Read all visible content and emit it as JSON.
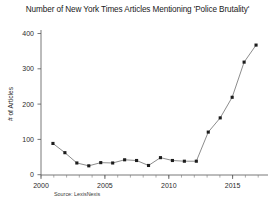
{
  "chart_data": {
    "type": "line",
    "title": "Number of New York Times Articles Mentioning 'Police Brutality'",
    "xlabel": "",
    "ylabel": "# of Articles",
    "source": "Source: LexisNexis",
    "grid": false,
    "legend": false,
    "xlim": [
      2000,
      2019
    ],
    "ylim": [
      0,
      430
    ],
    "xticks": [
      2000,
      2005,
      2010,
      2015
    ],
    "xtick_labels": [
      "2000",
      "2005",
      "2010",
      "2015"
    ],
    "yticks": [
      0,
      100,
      200,
      300,
      400
    ],
    "ytick_labels": [
      "0",
      "100",
      "200",
      "300",
      "400"
    ],
    "marker": "square",
    "x": [
      2001,
      2002,
      2003,
      2004,
      2005,
      2006,
      2007,
      2008,
      2009,
      2010,
      2011,
      2012,
      2013,
      2014,
      2015,
      2016,
      2017,
      2018
    ],
    "values": [
      88,
      62,
      33,
      25,
      34,
      33,
      42,
      40,
      26,
      48,
      40,
      38,
      38,
      120,
      160,
      218,
      317,
      365
    ],
    "series": [
      {
        "name": "# of Articles",
        "values": [
          88,
          62,
          33,
          25,
          34,
          33,
          42,
          40,
          26,
          48,
          40,
          38,
          38,
          120,
          160,
          218,
          317,
          365
        ]
      }
    ],
    "annotations": []
  }
}
